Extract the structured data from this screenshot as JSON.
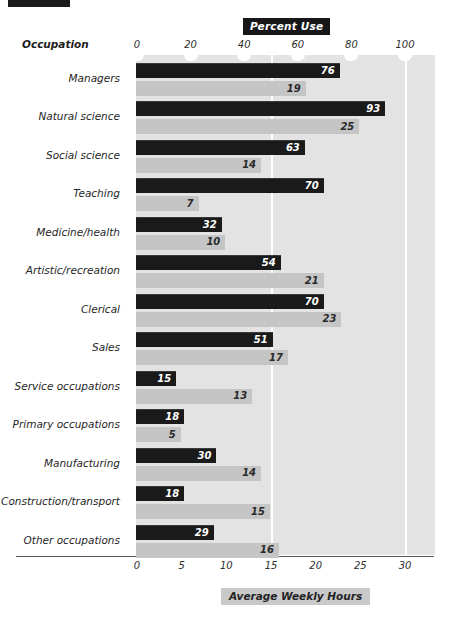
{
  "decorations": {
    "top_crop_bar": "black-bar-cropped"
  },
  "header": {
    "category_axis_title": "Occupation"
  },
  "chart_data": {
    "type": "bar",
    "orientation": "horizontal",
    "title": "Percent Use",
    "xlabel_top": "Percent Use",
    "xlabel_bottom": "Average Weekly Hours",
    "ylabel": "Occupation",
    "grid": true,
    "legend_position": "none",
    "top_axis": {
      "label": "Percent Use",
      "ticks": [
        0,
        20,
        40,
        60,
        80,
        100
      ],
      "tick_labels": [
        "0",
        "20",
        "40",
        "60",
        "80",
        "100"
      ],
      "lim": [
        0,
        100
      ]
    },
    "bottom_axis": {
      "label": "Average Weekly Hours",
      "ticks": [
        0,
        5,
        10,
        15,
        20,
        25,
        30
      ],
      "tick_labels": [
        "0",
        "5",
        "10",
        "15",
        "20",
        "25",
        "30"
      ],
      "lim": [
        0,
        30
      ]
    },
    "categories": [
      "Managers",
      "Natural science",
      "Social science",
      "Teaching",
      "Medicine/health",
      "Artistic/recreation",
      "Clerical",
      "Sales",
      "Service occupations",
      "Primary occupations",
      "Manufacturing",
      "Construction/transport",
      "Other occupations"
    ],
    "series": [
      {
        "name": "Percent Use",
        "axis": "top",
        "color": "#1a1a1a",
        "values": [
          76,
          93,
          63,
          70,
          32,
          54,
          70,
          51,
          15,
          18,
          30,
          18,
          29
        ]
      },
      {
        "name": "Average Weekly Hours",
        "axis": "bottom",
        "color": "#c5c5c5",
        "values": [
          19,
          25,
          14,
          7,
          10,
          21,
          23,
          17,
          13,
          5,
          14,
          15,
          16
        ]
      }
    ],
    "colors": {
      "dark_series": "#1a1a1a",
      "light_series": "#c5c5c5",
      "panel_background": "#e3e3e3",
      "gridline": "#ffffff",
      "title_box_background": "#17171a",
      "title_box_text": "#ffffff",
      "bottom_label_box_background": "#c9c9c9"
    }
  }
}
